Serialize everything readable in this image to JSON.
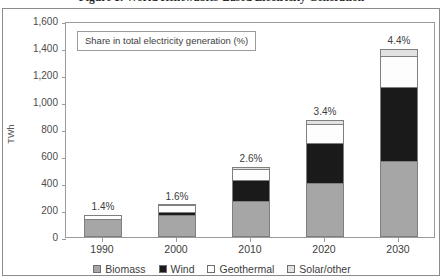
{
  "figure": {
    "title": "Figure 1: World Renewables-Based Electricity Generation"
  },
  "note": {
    "text": "Share in total electricity generation (%)"
  },
  "axes": {
    "y_title": "TWh",
    "y_ticks": [
      "1,600",
      "1,400",
      "1,200",
      "1,000",
      "800",
      "600",
      "400",
      "200",
      "0"
    ]
  },
  "legend": {
    "items": [
      {
        "label": "Biomass",
        "color": "#a6a6a6"
      },
      {
        "label": "Wind",
        "color": "#1a1a1a"
      },
      {
        "label": "Geothermal",
        "color": "#fdfdfd"
      },
      {
        "label": "Solar/other",
        "color": "#e2e2e2"
      }
    ]
  },
  "chart_data": {
    "type": "bar",
    "title": "Figure 1: World Renewables-Based Electricity Generation",
    "subtitle": "Share in total electricity generation (%)",
    "xlabel": "",
    "ylabel": "TWh",
    "ylim": [
      0,
      1600
    ],
    "ytick_step": 200,
    "grid": false,
    "legend_position": "bottom",
    "stacked": true,
    "categories": [
      "1990",
      "2000",
      "2010",
      "2020",
      "2030"
    ],
    "series": [
      {
        "name": "Biomass",
        "color": "#a6a6a6",
        "values": [
          130,
          160,
          270,
          400,
          560
        ]
      },
      {
        "name": "Wind",
        "color": "#1a1a1a",
        "values": [
          0,
          25,
          150,
          300,
          550
        ]
      },
      {
        "name": "Geothermal",
        "color": "#fdfdfd",
        "values": [
          30,
          50,
          85,
          135,
          230
        ]
      },
      {
        "name": "Solar/other",
        "color": "#e2e2e2",
        "values": [
          0,
          5,
          15,
          35,
          50
        ]
      }
    ],
    "totals": [
      160,
      240,
      520,
      870,
      1390
    ],
    "annotations": [
      {
        "category": "1990",
        "text": "1.4%"
      },
      {
        "category": "2000",
        "text": "1.6%"
      },
      {
        "category": "2010",
        "text": "2.6%"
      },
      {
        "category": "2020",
        "text": "3.4%"
      },
      {
        "category": "2030",
        "text": "4.4%"
      }
    ]
  }
}
